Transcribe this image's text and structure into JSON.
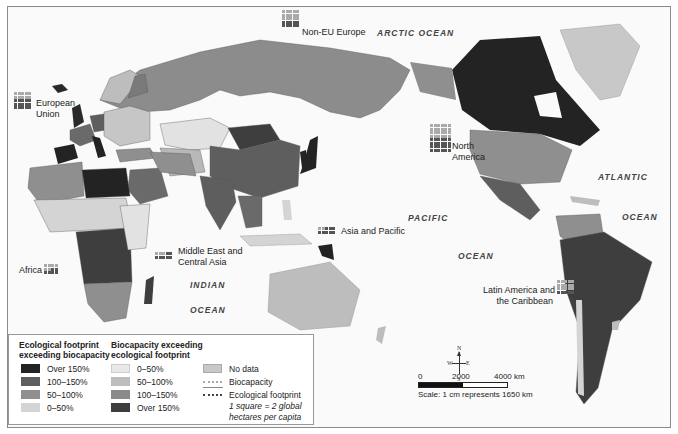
{
  "map": {
    "region_labels": {
      "european_union": [
        "European",
        "Union"
      ],
      "non_eu_europe": "Non-EU Europe",
      "north_america": [
        "North",
        "America"
      ],
      "asia_pacific": "Asia and Pacific",
      "middle_east": [
        "Middle East and",
        "Central Asia"
      ],
      "africa": "Africa",
      "latin_america": [
        "Latin America and",
        "the Caribbean"
      ]
    },
    "ocean_labels": {
      "arctic": "ARCTIC OCEAN",
      "atlantic_1": "ATLANTIC",
      "atlantic_2": "OCEAN",
      "pacific_1": "PACIFIC",
      "pacific_2": "OCEAN",
      "indian_1": "INDIAN",
      "indian_2": "OCEAN"
    }
  },
  "legend": {
    "group1_title": [
      "Ecological footprint",
      "exceeding biocapacity"
    ],
    "group1_items": [
      {
        "label": "Over 150%",
        "color": "#232323"
      },
      {
        "label": "100–150%",
        "color": "#5e5e5e"
      },
      {
        "label": "50–100%",
        "color": "#8f8f8f"
      },
      {
        "label": "0–50%",
        "color": "#d4d4d4"
      }
    ],
    "group2_title": [
      "Biocapacity exceeding",
      "ecological footprint"
    ],
    "group2_items": [
      {
        "label": "0–50%",
        "color": "#e8e8e8"
      },
      {
        "label": "50–100%",
        "color": "#bdbdbd"
      },
      {
        "label": "100–150%",
        "color": "#8a8a8a"
      },
      {
        "label": "Over 150%",
        "color": "#3e3e3e"
      }
    ],
    "other_items": [
      {
        "label": "No data",
        "color": "#c8c8c8"
      },
      {
        "label": "Biocapacity",
        "style": "dotted-light"
      },
      {
        "label": "Ecological footprint",
        "style": "dotted-dark"
      }
    ],
    "note": [
      "1 square = 2 global",
      "hectares per capita"
    ]
  },
  "compass": {
    "n": "N",
    "s": "S",
    "e": "E",
    "w": "W"
  },
  "scale_bar": {
    "ticks": [
      "0",
      "2000",
      "4000 km"
    ],
    "caption": "Scale: 1 cm represents 1650 km"
  }
}
